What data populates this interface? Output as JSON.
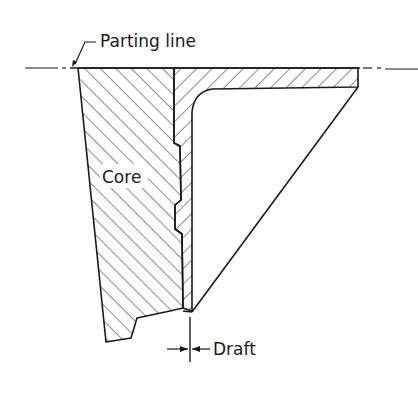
{
  "diagram": {
    "type": "engineering cross-section",
    "labels": {
      "parting_line": "Parting line",
      "core": "Core",
      "draft": "Draft"
    },
    "colors": {
      "ink": "#1a1a1a",
      "background": "#ffffff"
    }
  }
}
